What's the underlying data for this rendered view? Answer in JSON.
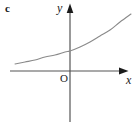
{
  "figure": {
    "part_label": "c",
    "background_color": "#ffffff",
    "width": 140,
    "height": 128
  },
  "axes": {
    "x_label": "x",
    "y_label": "y",
    "origin_label": "O",
    "axis_color": "#555555",
    "arrow_color": "#1b1b1b",
    "x_axis": {
      "x_start": 10,
      "x_end": 128,
      "y": 71
    },
    "y_axis": {
      "y_start": 5,
      "y_end": 122,
      "x": 70
    }
  },
  "chart_data": {
    "type": "line",
    "title": "c",
    "xlabel": "x",
    "ylabel": "y",
    "grid": false,
    "legend": null,
    "annotations": [
      "O"
    ],
    "xlim": [
      -60,
      61
    ],
    "ylim": [
      0,
      57
    ],
    "curve_color": "#8a8a8a",
    "series": [
      {
        "name": "exponential",
        "points_px": [
          [
            15,
            64
          ],
          [
            25,
            62
          ],
          [
            35,
            60
          ],
          [
            45,
            57
          ],
          [
            55,
            55
          ],
          [
            65,
            52
          ],
          [
            70,
            51
          ],
          [
            80,
            47
          ],
          [
            90,
            42
          ],
          [
            100,
            36
          ],
          [
            110,
            30
          ],
          [
            120,
            22
          ],
          [
            131,
            14
          ]
        ],
        "x": [
          -55,
          -45,
          -35,
          -25,
          -15,
          -5,
          0,
          10,
          20,
          30,
          40,
          50,
          61
        ],
        "values": [
          7,
          9,
          11,
          14,
          16,
          19,
          20,
          24,
          29,
          35,
          41,
          49,
          57
        ]
      }
    ]
  }
}
